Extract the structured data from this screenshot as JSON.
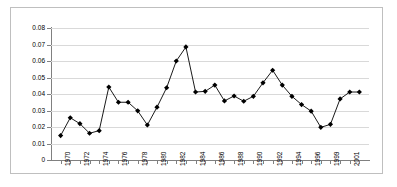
{
  "chart_data": {
    "type": "line",
    "title": "",
    "subtitle": "",
    "xlabel": "",
    "ylabel": "",
    "grid": true,
    "legend": false,
    "legend_position": "none",
    "marker": "diamond",
    "line_color": "#000000",
    "marker_color": "#000000",
    "gridline_color": "#d9d9d9",
    "axis_color": "#808080",
    "border_color": "#bfbfbf",
    "background_color": "#ffffff",
    "ylim": [
      0,
      0.08
    ],
    "ytick_labels": [
      "0.08",
      "0.07",
      "0.06",
      "0.05",
      "0.04",
      "0.03",
      "0.02",
      "0.01",
      "0"
    ],
    "ytick_values": [
      0.08,
      0.07,
      0.06,
      0.05,
      0.04,
      0.03,
      0.02,
      0.01,
      0
    ],
    "categories": [
      "1970",
      "1971",
      "1972",
      "1973",
      "1974",
      "1975",
      "1976",
      "1977",
      "1978",
      "1979",
      "1980",
      "1981",
      "1982",
      "1983",
      "1984",
      "1985",
      "1986",
      "1987",
      "1988",
      "1989",
      "1990",
      "1991",
      "1992",
      "1993",
      "1994",
      "1995",
      "1996",
      "1997",
      "1999",
      "2000",
      "2001",
      "2002"
    ],
    "xtick_labels_shown": [
      "1970",
      "1972",
      "1974",
      "1976",
      "1978",
      "1980",
      "1982",
      "1984",
      "1986",
      "1988",
      "1990",
      "1992",
      "1994",
      "1996",
      "1999",
      "2001"
    ],
    "values": [
      0.0148,
      0.0256,
      0.022,
      0.0162,
      0.0178,
      0.0442,
      0.035,
      0.035,
      0.0298,
      0.0212,
      0.032,
      0.0438,
      0.06,
      0.0685,
      0.0412,
      0.0416,
      0.0454,
      0.0358,
      0.0388,
      0.0356,
      0.0386,
      0.0468,
      0.0544,
      0.0454,
      0.0386,
      0.0336,
      0.0296,
      0.0198,
      0.0216,
      0.037,
      0.0412,
      0.0412
    ],
    "value_labels_visible": false
  }
}
